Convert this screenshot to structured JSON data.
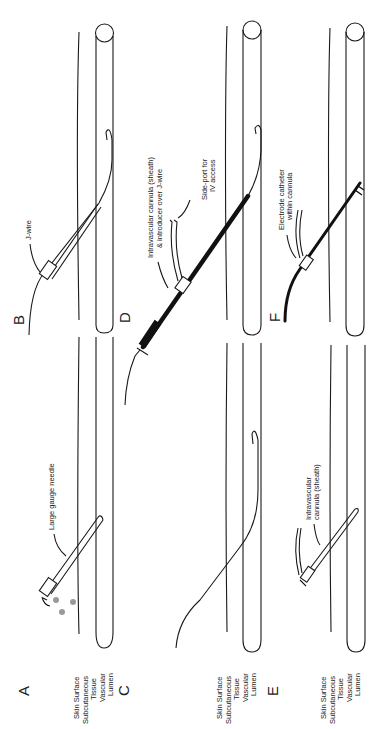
{
  "figure": {
    "orientation": "rotated-90-ccw",
    "panels": [
      {
        "id": "A",
        "label": "A",
        "annotation": "Large gauge needle"
      },
      {
        "id": "B",
        "label": "B",
        "annotation": "J-wire"
      },
      {
        "id": "C",
        "label": "C",
        "annotation": ""
      },
      {
        "id": "D",
        "label": "D",
        "annotation_1": "Intravascular cannula (sheath)",
        "annotation_2": "& introducer over J-wire",
        "annotation_3": "Side-port for",
        "annotation_4": "IV access"
      },
      {
        "id": "E",
        "label": "E",
        "annotation_1": "Intravascular",
        "annotation_2": "cannula (sheath)"
      },
      {
        "id": "F",
        "label": "F",
        "annotation_1": "Electrode catheter",
        "annotation_2": "within cannula"
      }
    ],
    "layer_labels": {
      "skin": "Skin Surface",
      "subq_1": "Subcutaneous",
      "subq_2": "Tissue",
      "vasc_1": "Vascular",
      "vasc_2": "Lumen"
    }
  }
}
